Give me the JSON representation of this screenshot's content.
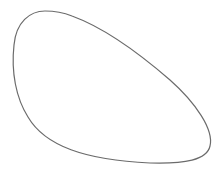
{
  "diagram": {
    "shape": "closed-blob-curve",
    "stroke_color": "#6b6b6b",
    "fill_color": "#ffffff",
    "background": "#ffffff"
  }
}
